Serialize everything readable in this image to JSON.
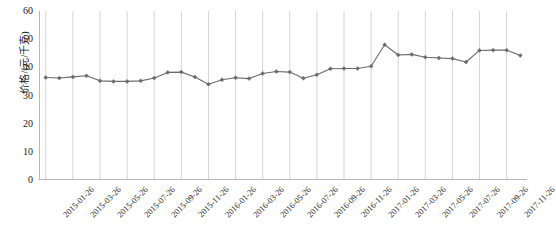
{
  "chart_data": {
    "type": "line",
    "title": "",
    "xlabel": "",
    "ylabel": "价格/(元/千克)",
    "ylim": [
      0,
      60
    ],
    "yticks": [
      0,
      10,
      20,
      30,
      40,
      50,
      60
    ],
    "grid": "vertical-only",
    "legend": "none",
    "series_color": "#6b6b6b",
    "marker": "diamond",
    "x_tick_labels": [
      "2015-01-26",
      "2015-03-26",
      "2015-05-26",
      "2015-07-26",
      "2015-09-26",
      "2015-11-26",
      "2016-01-26",
      "2016-03-26",
      "2016-05-26",
      "2016-07-26",
      "2016-09-26",
      "2016-11-26",
      "2017-01-26",
      "2017-03-26",
      "2017-05-26",
      "2017-07-26",
      "2017-09-26",
      "2017-11-26"
    ],
    "x": [
      "2015-01-26",
      "2015-02-26",
      "2015-03-26",
      "2015-04-26",
      "2015-05-26",
      "2015-06-26",
      "2015-07-26",
      "2015-08-26",
      "2015-09-26",
      "2015-10-26",
      "2015-11-26",
      "2015-12-26",
      "2016-01-26",
      "2016-02-26",
      "2016-03-26",
      "2016-04-26",
      "2016-05-26",
      "2016-06-26",
      "2016-07-26",
      "2016-08-26",
      "2016-09-26",
      "2016-10-26",
      "2016-11-26",
      "2016-12-26",
      "2017-01-26",
      "2017-02-26",
      "2017-03-26",
      "2017-04-26",
      "2017-05-26",
      "2017-06-26",
      "2017-07-26",
      "2017-08-26",
      "2017-09-26",
      "2017-10-26",
      "2017-11-26",
      "2017-12-26"
    ],
    "values": [
      36.4,
      36.2,
      36.6,
      37.0,
      35.2,
      35.0,
      35.0,
      35.2,
      36.2,
      38.2,
      38.3,
      36.6,
      34.0,
      35.6,
      36.3,
      36.0,
      37.8,
      38.5,
      38.3,
      36.1,
      37.4,
      39.5,
      39.6,
      39.6,
      40.4,
      48.0,
      44.4,
      44.6,
      43.6,
      43.3,
      43.1,
      41.9,
      46.0,
      46.1,
      46.1,
      44.2
    ],
    "series": [
      {
        "name": "价格",
        "values": [
          36.4,
          36.2,
          36.6,
          37.0,
          35.2,
          35.0,
          35.0,
          35.2,
          36.2,
          38.2,
          38.3,
          36.6,
          34.0,
          35.6,
          36.3,
          36.0,
          37.8,
          38.5,
          38.3,
          36.1,
          37.4,
          39.5,
          39.6,
          39.6,
          40.4,
          48.0,
          44.4,
          44.6,
          43.6,
          43.3,
          43.1,
          41.9,
          46.0,
          46.1,
          46.1,
          44.2
        ]
      }
    ]
  },
  "axes": {
    "y_axis_label": "价格/(元/千克)"
  }
}
